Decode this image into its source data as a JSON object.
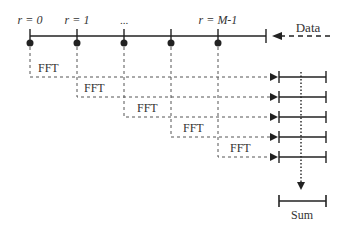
{
  "diagram": {
    "segment_labels": [
      {
        "text": "r = 0",
        "x": 30
      },
      {
        "text": "r = 1",
        "x": 77
      },
      {
        "text": "...",
        "x": 124
      },
      {
        "text": "r = M-1",
        "x": 218
      }
    ],
    "input_label": "Data",
    "block_label": "FFT",
    "output_label": "Sum",
    "segment_positions": [
      30,
      77,
      124,
      171,
      218
    ],
    "row_positions": [
      77,
      97,
      117,
      137,
      157
    ],
    "colors": {
      "line": "#222222",
      "dashed": "#555555",
      "text": "#333333"
    }
  }
}
